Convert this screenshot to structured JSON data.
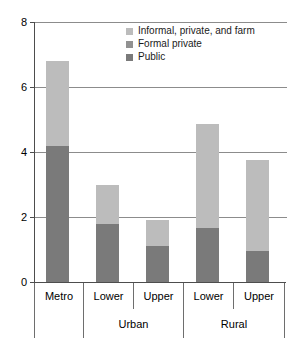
{
  "chart_data": {
    "type": "bar",
    "title": "",
    "xlabel": "",
    "ylabel": "",
    "ylim": [
      0,
      8
    ],
    "yticks": [
      0,
      2,
      4,
      6,
      8
    ],
    "grid": true,
    "stacked": true,
    "legend_position": "top-right",
    "categories": [
      "Metro",
      "Lower",
      "Upper",
      "Lower",
      "Upper"
    ],
    "group_labels": [
      "",
      "Urban",
      "Urban",
      "Rural",
      "Rural"
    ],
    "groups": [
      {
        "name": "",
        "categories": [
          "Metro"
        ]
      },
      {
        "name": "Urban",
        "categories": [
          "Lower",
          "Upper"
        ]
      },
      {
        "name": "Rural",
        "categories": [
          "Lower",
          "Upper"
        ]
      }
    ],
    "series": [
      {
        "name": "Public",
        "color": "#7a7a7a",
        "values": [
          4.2,
          1.8,
          1.1,
          1.65,
          0.95
        ]
      },
      {
        "name": "Formal private",
        "color": "#919191",
        "values": [
          0,
          0,
          0,
          0,
          0
        ]
      },
      {
        "name": "Informal, private, and farm",
        "color": "#bcbcbc",
        "values": [
          2.6,
          1.2,
          0.8,
          3.2,
          2.8
        ]
      }
    ],
    "totals": [
      6.8,
      3.0,
      1.9,
      4.85,
      3.75
    ]
  },
  "legend": {
    "items": [
      {
        "label": "Informal, private, and farm",
        "color": "#bcbcbc"
      },
      {
        "label": "Formal private",
        "color": "#919191"
      },
      {
        "label": "Public",
        "color": "#7a7a7a"
      }
    ]
  },
  "axis": {
    "y_tick_labels": [
      "0",
      "2",
      "4",
      "6",
      "8"
    ],
    "row1": [
      "Metro",
      "Lower",
      "Upper",
      "Lower",
      "Upper"
    ],
    "row2": [
      "",
      "Urban",
      "Rural"
    ]
  }
}
